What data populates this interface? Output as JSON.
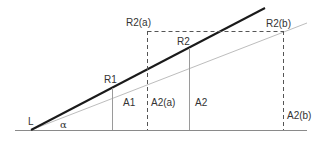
{
  "colors": {
    "thick_line": "#1a1a1a",
    "thin_line": "#bdbdbd",
    "baseline": "#8a8a8a",
    "vertical": "#9a9a9a",
    "dashed": "#555555",
    "text": "#333333",
    "background": "#ffffff"
  },
  "labels": {
    "L": "L",
    "alpha": "α",
    "R1": "R1",
    "A1": "A1",
    "R2a": "R2(a)",
    "A2a": "A2(a)",
    "R2": "R2",
    "A2": "A2",
    "R2b": "R2(b)",
    "A2b": "A2(b)"
  }
}
